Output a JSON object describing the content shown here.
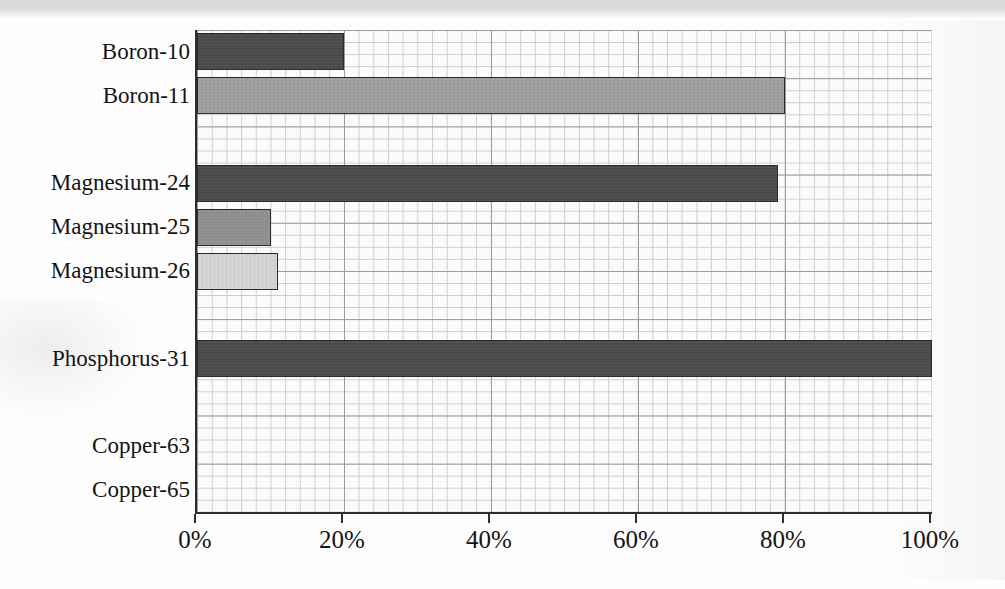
{
  "chart_data": {
    "type": "bar",
    "orientation": "horizontal",
    "title": "",
    "subtitle": "",
    "xlabel": "",
    "ylabel": "",
    "xlim": [
      0,
      100
    ],
    "xticks": [
      0,
      20,
      40,
      60,
      80,
      100
    ],
    "xtick_labels": [
      "0%",
      "20%",
      "40%",
      "60%",
      "80%",
      "100%"
    ],
    "grid": true,
    "grid_style": "graph-paper",
    "legend": "none",
    "categories": [
      "Boron-10",
      "Boron-11",
      "Magnesium-24",
      "Magnesium-25",
      "Magnesium-26",
      "Phosphorus-31",
      "Copper-63",
      "Copper-65"
    ],
    "values": [
      20,
      80,
      79,
      10,
      11,
      100,
      0,
      0
    ],
    "value_unit": "%",
    "bars": [
      {
        "label": "Boron-10",
        "value": 20,
        "color": "#4a4a4a",
        "slot": 1,
        "visible": true
      },
      {
        "label": "Boron-11",
        "value": 80,
        "color": "#9f9f9f",
        "slot": 2,
        "visible": true
      },
      {
        "label": "Magnesium-24",
        "value": 79,
        "color": "#4a4a4a",
        "slot": 4,
        "visible": true
      },
      {
        "label": "Magnesium-25",
        "value": 10,
        "color": "#8f8f8f",
        "slot": 5,
        "visible": true
      },
      {
        "label": "Magnesium-26",
        "value": 11,
        "color": "#d4d4d4",
        "slot": 6,
        "visible": true
      },
      {
        "label": "Phosphorus-31",
        "value": 100,
        "color": "#4a4a4a",
        "slot": 8,
        "visible": true
      },
      {
        "label": "Copper-63",
        "value": 0,
        "color": "#4a4a4a",
        "slot": 10,
        "visible": false
      },
      {
        "label": "Copper-65",
        "value": 0,
        "color": "#9f9f9f",
        "slot": 11,
        "visible": false
      }
    ],
    "slot_count": 11
  },
  "colors": {
    "bar_dark": "#4a4a4a",
    "bar_medium": "#9f9f9f",
    "bar_light": "#d4d4d4",
    "axis": "#2e2e2e",
    "grid_major": "#9d9d9d",
    "grid_minor": "#cfcfcf",
    "paper": "#fdfdfd",
    "text": "#141414"
  }
}
